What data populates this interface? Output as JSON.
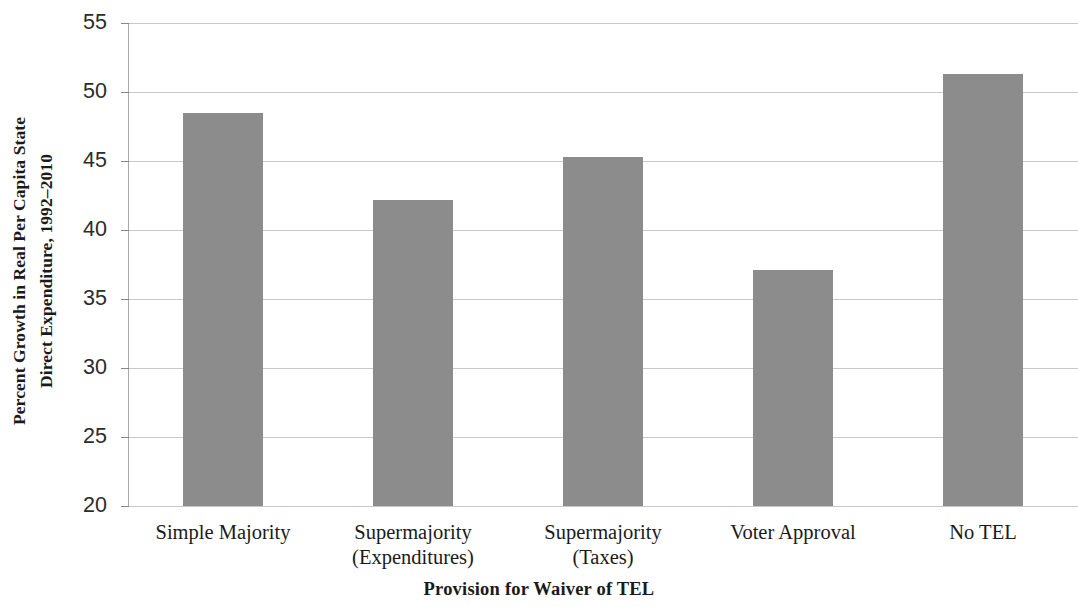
{
  "chart_data": {
    "type": "bar",
    "title": "",
    "xlabel": "Provision for Waiver of TEL",
    "ylabel": "Percent Growth in Real Per Capita State Direct Expenditure, 1992–2010",
    "ylabel_line1": "Percent Growth in Real Per Capita State",
    "ylabel_line2": "Direct Expenditure, 1992–2010",
    "categories": [
      "Simple Majority",
      "Supermajority (Expenditures)",
      "Supermajority (Taxes)",
      "Voter Approval",
      "No TEL"
    ],
    "category_lines": [
      [
        "Simple Majority",
        ""
      ],
      [
        "Supermajority",
        "(Expenditures)"
      ],
      [
        "Supermajority",
        "(Taxes)"
      ],
      [
        "Voter Approval",
        ""
      ],
      [
        "No TEL",
        ""
      ]
    ],
    "values": [
      48.5,
      42.2,
      45.3,
      37.1,
      51.3
    ],
    "ylim": [
      20,
      55
    ],
    "yticks": [
      20,
      25,
      30,
      35,
      40,
      45,
      50,
      55
    ],
    "ytick_labels": [
      "20",
      "25",
      "30",
      "35",
      "40",
      "45",
      "50",
      "55"
    ],
    "grid": true,
    "legend": false,
    "bar_color": "#8c8c8c",
    "gridline_color": "#c8c8c8",
    "axis_color": "#a9a9a9",
    "background": "#ffffff"
  }
}
